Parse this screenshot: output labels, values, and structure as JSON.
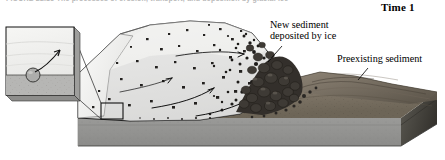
{
  "figure": {
    "caption_fragment": "FIGURE 22.15   The processes of erosion, transport, and deposition by glacial ice",
    "time_label": "Time 1"
  },
  "labels": {
    "new_sediment": {
      "line1": "New sediment",
      "line2": "deposited by ice"
    },
    "preexisting_sediment": "Preexisting sediment"
  },
  "colors": {
    "page_background": "#ffffff",
    "ice_body": "#e3e3e1",
    "ice_cut_face": "#f1f1ef",
    "ice_highlight": "#f7f7f5",
    "debris_dark": "#2c2a28",
    "debris_mid": "#4a4641",
    "ground_surface": "#8c8274",
    "ground_surface_dark": "#6b6256",
    "block_side": "#8a8a88",
    "block_side_dark": "#46443f",
    "block_front": "#909090",
    "inset_sky": "#f0f0ee",
    "inset_bed": "#b4b4b2",
    "outline": "#1a1a1a",
    "leader_line": "#000000"
  },
  "inset": {
    "name": "magnified-detail-box",
    "particle": "sediment-grain",
    "arrow": "transport-arrow"
  },
  "block_diagram": {
    "name": "glacier-block-diagram",
    "flow_arrows": 4,
    "callout_square": "inset-source-region"
  }
}
